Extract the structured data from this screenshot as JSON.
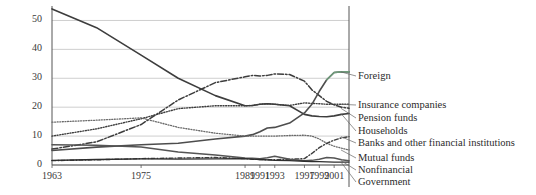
{
  "chart_data": {
    "type": "line",
    "title": "",
    "subtitle": "",
    "xlabel": "",
    "ylabel": "",
    "xlim": [
      1963,
      2003
    ],
    "ylim": [
      0,
      55
    ],
    "yticks": [
      0,
      10,
      20,
      30,
      40,
      50
    ],
    "ytick_labels": [
      "0",
      "10",
      "20",
      "30",
      "40",
      "50"
    ],
    "xticks": [
      1963,
      1975,
      1989,
      1991,
      1993,
      1997,
      1999,
      2001
    ],
    "xtick_labels": [
      "1963",
      "1975",
      "1989",
      "1991",
      "1993",
      "1997",
      "1999",
      "2001"
    ],
    "grid": "horizontal",
    "legend_position": "right-outside",
    "x": [
      1963,
      1969,
      1975,
      1980,
      1985,
      1989,
      1990,
      1991,
      1992,
      1993,
      1995,
      1997,
      1998,
      1999,
      2000,
      2001,
      2002,
      2003
    ],
    "series": [
      {
        "name": "Households",
        "label": "Households",
        "color": "#3d3d3d",
        "dash": "solid",
        "width": 1.6,
        "values": [
          54.0,
          47.5,
          38.0,
          30.0,
          24.0,
          20.5,
          20.6,
          21.0,
          21.2,
          21.0,
          20.5,
          17.5,
          17.0,
          16.8,
          16.7,
          17.0,
          17.5,
          17.8
        ]
      },
      {
        "name": "Pension funds",
        "label": "Pension funds",
        "color": "#3d3d3d",
        "dash": "dashdot",
        "width": 1.5,
        "values": [
          5.5,
          8.0,
          14.0,
          22.5,
          28.5,
          30.5,
          31.0,
          30.8,
          31.0,
          31.5,
          31.3,
          29.0,
          26.0,
          24.0,
          22.0,
          20.8,
          20.0,
          19.6
        ]
      },
      {
        "name": "Insurance companies",
        "label": "Insurance companies",
        "color": "#3d3d3d",
        "dash": "dotted",
        "width": 1.4,
        "values": [
          10.0,
          12.5,
          16.0,
          19.5,
          20.5,
          20.5,
          20.6,
          21.0,
          21.2,
          21.0,
          20.6,
          21.5,
          21.3,
          21.2,
          21.0,
          21.0,
          21.0,
          21.0
        ]
      },
      {
        "name": "Foreign",
        "label": "Foreign",
        "color": "#4d4d4d",
        "color_end": "#6f9b7b",
        "dash": "solid",
        "width": 1.6,
        "values": [
          5.0,
          6.2,
          7.0,
          7.5,
          9.0,
          10.0,
          10.5,
          11.5,
          12.8,
          13.0,
          14.5,
          18.0,
          21.0,
          25.5,
          29.5,
          32.0,
          32.2,
          32.2
        ]
      },
      {
        "name": "Mutual funds",
        "label": "Mutual funds",
        "color": "#6b6b6b",
        "dash": "dotted",
        "width": 1.3,
        "values": [
          14.8,
          15.5,
          16.3,
          13.0,
          11.0,
          10.0,
          10.0,
          10.0,
          10.0,
          10.0,
          10.2,
          10.3,
          10.0,
          9.0,
          7.5,
          6.5,
          5.8,
          5.2
        ]
      },
      {
        "name": "Banks and other financial institutions",
        "label": "Banks and other financial institutions",
        "color": "#3d3d3d",
        "dash": "dashdot2",
        "width": 1.4,
        "values": [
          1.5,
          1.8,
          2.2,
          2.4,
          2.6,
          2.2,
          2.0,
          1.9,
          1.8,
          1.8,
          2.0,
          2.2,
          4.0,
          6.0,
          7.5,
          8.6,
          9.4,
          9.8
        ]
      },
      {
        "name": "Nonfinancial",
        "label": "Nonfinancial",
        "color": "#555555",
        "dash": "solid",
        "width": 1.5,
        "values": [
          7.0,
          6.8,
          6.2,
          4.5,
          3.5,
          2.4,
          2.3,
          2.2,
          2.5,
          3.0,
          2.0,
          1.5,
          1.6,
          2.0,
          2.6,
          2.4,
          1.8,
          1.5
        ]
      },
      {
        "name": "Government",
        "label": "Government",
        "color": "#2e2e2e",
        "dash": "solid",
        "width": 1.3,
        "values": [
          1.6,
          1.9,
          2.1,
          2.0,
          2.1,
          2.2,
          2.0,
          1.9,
          1.8,
          1.6,
          1.5,
          1.3,
          1.2,
          1.2,
          1.1,
          1.0,
          1.0,
          1.0
        ]
      }
    ],
    "legend_entries": [
      {
        "label": "Foreign",
        "y_px": 76
      },
      {
        "label": "Insurance companies",
        "y_px": 105
      },
      {
        "label": "Pension funds",
        "y_px": 118
      },
      {
        "label": "Households",
        "y_px": 131
      },
      {
        "label": "Banks and other financial institutions",
        "y_px": 143
      },
      {
        "label": "Mutual funds",
        "y_px": 158
      },
      {
        "label": "Nonfinancial",
        "y_px": 170
      },
      {
        "label": "Government",
        "y_px": 182
      }
    ]
  }
}
